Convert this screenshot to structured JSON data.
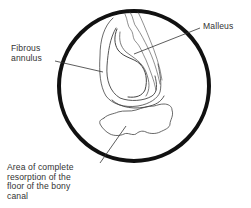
{
  "diagram": {
    "labels": {
      "fibrous_annulus": "Fibrous\nannulus",
      "malleus": "Malleus",
      "resorption": "Area of complete\nresorption of the\nfloor of the bony\ncanal"
    },
    "colors": {
      "circle": "#111111",
      "sketch": "#444444",
      "leader": "#333333",
      "text": "#333333",
      "background": "#ffffff"
    }
  }
}
